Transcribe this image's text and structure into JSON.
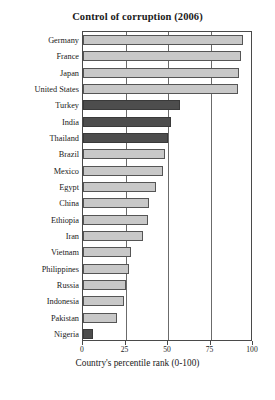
{
  "chart_data": {
    "type": "bar",
    "orientation": "horizontal",
    "title": "Control of corruption (2006)",
    "xlabel": "Country's percentile rank (0-100)",
    "ylabel": "",
    "xlim": [
      0,
      100
    ],
    "xticks": [
      0,
      25,
      50,
      75,
      100
    ],
    "grid": "vertical",
    "legend": "none",
    "categories": [
      "Germany",
      "France",
      "Japan",
      "United States",
      "Turkey",
      "India",
      "Thailand",
      "Brazil",
      "Mexico",
      "Egypt",
      "China",
      "Ethiopia",
      "Iran",
      "Vietnam",
      "Philippines",
      "Russia",
      "Indonesia",
      "Pakistan",
      "Nigeria"
    ],
    "values": [
      94,
      93,
      92,
      91,
      57,
      52,
      50,
      48,
      47,
      43,
      39,
      38,
      35,
      28,
      27,
      25,
      24,
      20,
      6
    ],
    "bar_styles": [
      "light",
      "light",
      "light",
      "light",
      "dark",
      "dark",
      "dark",
      "light",
      "light",
      "light",
      "light",
      "light",
      "light",
      "light",
      "light",
      "light",
      "light",
      "light",
      "dark"
    ],
    "colors": {
      "light_bar": "#c8c8c8",
      "dark_bar": "#4d4d4d",
      "bar_border": "#555555",
      "axis": "#4a4a4a",
      "gridline": "#6b6b6b",
      "background": "#ffffff",
      "text": "#1a1a1a"
    }
  }
}
